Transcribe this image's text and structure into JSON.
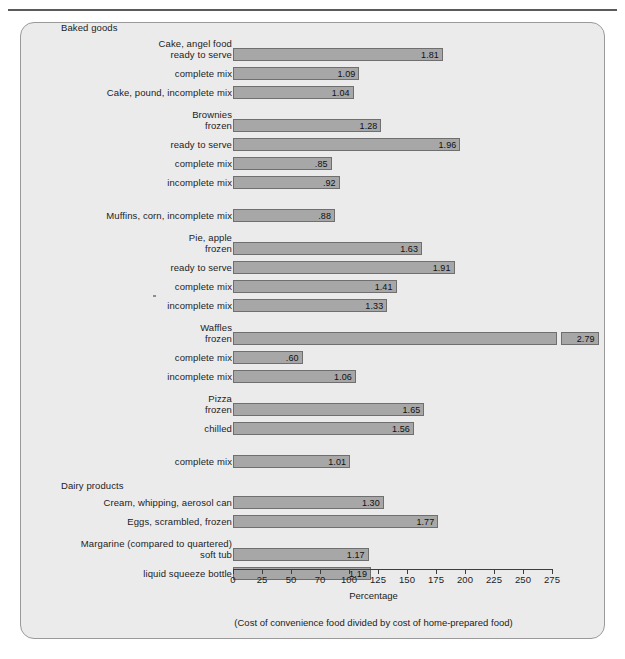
{
  "chart_data": {
    "type": "bar",
    "orientation": "horizontal",
    "title": "",
    "xlabel": "Percentage",
    "ylabel": "",
    "footnote": "(Cost of convenience food divided by cost of home-prepared food)",
    "xlim": [
      0,
      275
    ],
    "xticks": [
      "0",
      "25",
      "50",
      "70",
      "100",
      "125",
      "150",
      "175",
      "200",
      "225",
      "250",
      "275"
    ],
    "xtick_values": [
      0,
      25,
      50,
      75,
      100,
      125,
      150,
      175,
      200,
      225,
      250,
      275
    ],
    "grid": false,
    "legend": "none",
    "value_label_format": "ratio (percentage/100), leading zero omitted below 1",
    "groups": [
      {
        "name": "Baked goods",
        "items": [
          {
            "caption": [
              "Cake, angel food",
              "ready to serve"
            ],
            "label_lines": 2,
            "value": 1.81,
            "value_text": "1.81"
          },
          {
            "caption": [
              "complete mix"
            ],
            "label_lines": 1,
            "value": 1.09,
            "value_text": "1.09"
          },
          {
            "caption": [
              "Cake, pound, incomplete mix"
            ],
            "label_lines": 1,
            "value": 1.04,
            "value_text": "1.04"
          },
          {
            "caption": [
              "Brownies",
              "frozen"
            ],
            "label_lines": 2,
            "value": 1.28,
            "value_text": "1.28",
            "gap_before": true
          },
          {
            "caption": [
              "ready to serve"
            ],
            "label_lines": 1,
            "value": 1.96,
            "value_text": "1.96"
          },
          {
            "caption": [
              "complete mix"
            ],
            "label_lines": 1,
            "value": 0.85,
            "value_text": ".85"
          },
          {
            "caption": [
              "incomplete mix"
            ],
            "label_lines": 1,
            "value": 0.92,
            "value_text": ".92"
          },
          {
            "caption": [
              "Muffins, corn, incomplete mix"
            ],
            "label_lines": 1,
            "value": 0.88,
            "value_text": ".88",
            "gap_before": true
          },
          {
            "caption": [
              "Pie, apple",
              "frozen"
            ],
            "label_lines": 2,
            "value": 1.63,
            "value_text": "1.63",
            "gap_before": true
          },
          {
            "caption": [
              "ready to serve"
            ],
            "label_lines": 1,
            "value": 1.91,
            "value_text": "1.91"
          },
          {
            "caption": [
              "complete mix"
            ],
            "label_lines": 1,
            "value": 1.41,
            "value_text": "1.41"
          },
          {
            "caption": [
              "incomplete mix"
            ],
            "label_lines": 1,
            "value": 1.33,
            "value_text": "1.33"
          },
          {
            "caption": [
              "Waffles",
              "frozen"
            ],
            "label_lines": 2,
            "value": 2.79,
            "value_text": "2.79",
            "value_outside": true,
            "gap_before": true
          },
          {
            "caption": [
              "complete mix"
            ],
            "label_lines": 1,
            "value": 0.6,
            "value_text": ".60"
          },
          {
            "caption": [
              "incomplete mix"
            ],
            "label_lines": 1,
            "value": 1.06,
            "value_text": "1.06"
          },
          {
            "caption": [
              "Pizza",
              "frozen"
            ],
            "label_lines": 2,
            "value": 1.65,
            "value_text": "1.65",
            "gap_before": true
          },
          {
            "caption": [
              "chilled"
            ],
            "label_lines": 1,
            "value": 1.56,
            "value_text": "1.56"
          },
          {
            "caption": [
              "complete mix"
            ],
            "label_lines": 1,
            "value": 1.01,
            "value_text": "1.01",
            "gap_before": true
          }
        ]
      },
      {
        "name": "Dairy products",
        "items": [
          {
            "caption": [
              "Cream, whipping, aerosol can"
            ],
            "label_lines": 1,
            "value": 1.3,
            "value_text": "1.30"
          },
          {
            "caption": [
              "Eggs, scrambled, frozen"
            ],
            "label_lines": 1,
            "value": 1.77,
            "value_text": "1.77"
          },
          {
            "caption": [
              "Margarine (compared to quartered)",
              "soft tub"
            ],
            "label_lines": 2,
            "value": 1.17,
            "value_text": "1.17",
            "gap_before": true
          },
          {
            "caption": [
              "liquid squeeze bottle"
            ],
            "label_lines": 1,
            "value": 1.19,
            "value_text": "1.19"
          }
        ]
      }
    ]
  },
  "rows": [
    {
      "cap1": "Cake, angel food",
      "cap2": "ready to serve",
      "val": "1.81"
    },
    {
      "cap1": "",
      "cap2": "complete mix",
      "val": "1.09"
    },
    {
      "cap1": "",
      "cap2": "Cake, pound, incomplete mix",
      "val": "1.04"
    },
    {
      "cap1": "Brownies",
      "cap2": "frozen",
      "val": "1.28"
    },
    {
      "cap1": "",
      "cap2": "ready to serve",
      "val": "1.96"
    },
    {
      "cap1": "",
      "cap2": "complete mix",
      "val": ".85"
    },
    {
      "cap1": "",
      "cap2": "incomplete mix",
      "val": ".92"
    },
    {
      "cap1": "",
      "cap2": "Muffins, corn, incomplete mix",
      "val": ".88"
    },
    {
      "cap1": "Pie, apple",
      "cap2": "frozen",
      "val": "1.63"
    },
    {
      "cap1": "",
      "cap2": "ready to serve",
      "val": "1.91"
    },
    {
      "cap1": "",
      "cap2": "complete mix",
      "val": "1.41"
    },
    {
      "cap1": "",
      "cap2": "incomplete mix",
      "val": "1.33"
    },
    {
      "cap1": "Waffles",
      "cap2": "frozen",
      "val": "2.79"
    },
    {
      "cap1": "",
      "cap2": "complete mix",
      "val": ".60"
    },
    {
      "cap1": "",
      "cap2": "incomplete mix",
      "val": "1.06"
    },
    {
      "cap1": "Pizza",
      "cap2": "frozen",
      "val": "1.65"
    },
    {
      "cap1": "",
      "cap2": "chilled",
      "val": "1.56"
    },
    {
      "cap1": "",
      "cap2": "complete mix",
      "val": "1.01"
    },
    {
      "cap1": "",
      "cap2": "Cream, whipping, aerosol can",
      "val": "1.30"
    },
    {
      "cap1": "",
      "cap2": "Eggs, scrambled, frozen",
      "val": "1.77"
    },
    {
      "cap1": "Margarine (compared to quartered)",
      "cap2": "soft tub",
      "val": "1.17"
    },
    {
      "cap1": "",
      "cap2": "liquid squeeze bottle",
      "val": "1.19"
    }
  ],
  "group_headings": {
    "baked_goods": "Baked goods",
    "dairy_products": "Dairy products"
  },
  "axis": {
    "title": "Percentage",
    "footnote": "(Cost of convenience food divided by cost of home-prepared food)",
    "ticks": [
      "0",
      "25",
      "50",
      "70",
      "100",
      "125",
      "150",
      "175",
      "200",
      "225",
      "250",
      "275"
    ]
  },
  "colors": {
    "panel_bg": "#ebebeb",
    "bar_fill": "#a7a7a7",
    "bar_stroke": "#6f6f6f",
    "text": "#1c1c1c",
    "axis": "#3d3d3d"
  }
}
